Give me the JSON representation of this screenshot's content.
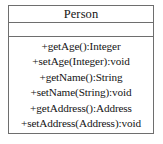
{
  "diagram": {
    "type": "uml-class-diagram",
    "border_color": "#6e6e6e",
    "background_color": "#ffffff",
    "text_color": "#141414"
  },
  "uml_class": {
    "name": "Person",
    "attributes": [],
    "operations": [
      {
        "label": "+getAge():Integer"
      },
      {
        "label": "+setAge(Integer):void"
      },
      {
        "label": "+getName():String"
      },
      {
        "label": "+setName(String):void"
      },
      {
        "label": "+getAddress():Address"
      },
      {
        "label": "+setAddress(Address):void"
      }
    ]
  }
}
